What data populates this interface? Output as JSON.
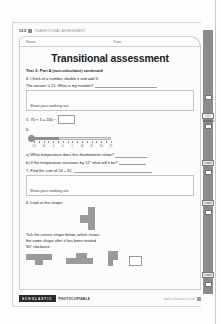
{
  "sheet": {
    "code": "13.5",
    "running_head": "TRANSITIONAL ASSESSMENT",
    "name_label": "Name",
    "date_label": "Date",
    "title": "Transitional assessment",
    "subhead": "Test 3: Part A (non-calculator) continued",
    "working_prompt": "Show your working out.",
    "questions": {
      "q4_text": "4. I think of a number, double it and add 3.",
      "q4_followup": "The answer is 51. What is my number?",
      "q5_equation": "5. 70 × 3  =  240 −",
      "q6_number": "6.",
      "q6a": "a) What temperature does this thermometer show?",
      "q6b": "b) If the temperature increases by 12° what will it be?",
      "q7_text": "7. Find the sum of 24 + 32.",
      "q8_text": "8. Look at this shape:",
      "q8_instruction_line1": "Tick the correct shape below, which shows",
      "q8_instruction_line2": "the same shape after it has been rotated",
      "q8_instruction_line3": "90° clockwise."
    },
    "thermometer": {
      "tick_labels": [
        "-15",
        "-10",
        "-5",
        "0",
        "5",
        "10",
        "15",
        "20",
        "25"
      ],
      "reading": "5"
    },
    "footer": {
      "badge": "SCHOLASTIC",
      "photocopiable": "PHOTOCOPIABLE",
      "note": "www.scholastic.co.uk"
    }
  },
  "rail": {
    "tabs": [
      "1 bookmark",
      "1 note",
      "1 note",
      "1 note"
    ]
  },
  "colors": {
    "shape_fill": "#9a9a9a",
    "rail_track": "#8c8c8c",
    "ink": "#252525"
  }
}
